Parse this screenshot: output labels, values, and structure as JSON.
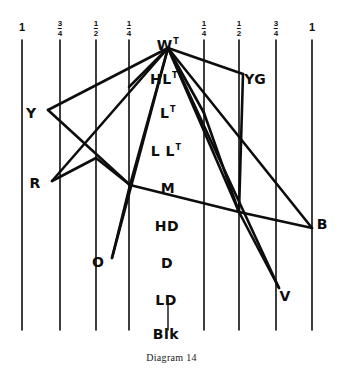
{
  "figure": {
    "caption": "Diagram 14",
    "caption_y": 352,
    "ink_color": "#0d0d0d",
    "background_color": "#ffffff",
    "width": 343,
    "height": 380
  },
  "scale_axis": {
    "name": "chroma-scale",
    "ticks": [
      {
        "label": "1",
        "numerator": "",
        "denominator": "",
        "x": 22,
        "label_y": 22,
        "line_top": 40,
        "line_bottom": 330
      },
      {
        "label": "3/4",
        "numerator": "3",
        "denominator": "4",
        "x": 60,
        "label_y": 20,
        "line_top": 40,
        "line_bottom": 330
      },
      {
        "label": "1/2",
        "numerator": "1",
        "denominator": "2",
        "x": 96,
        "label_y": 20,
        "line_top": 40,
        "line_bottom": 330
      },
      {
        "label": "1/4",
        "numerator": "1",
        "denominator": "4",
        "x": 129,
        "label_y": 20,
        "line_top": 40,
        "line_bottom": 330
      },
      {
        "label": "1/4",
        "numerator": "1",
        "denominator": "4",
        "x": 204,
        "label_y": 20,
        "line_top": 40,
        "line_bottom": 330
      },
      {
        "label": "1/2",
        "numerator": "1",
        "denominator": "2",
        "x": 239,
        "label_y": 20,
        "line_top": 40,
        "line_bottom": 330
      },
      {
        "label": "3/4",
        "numerator": "3",
        "denominator": "4",
        "x": 276,
        "label_y": 20,
        "line_top": 40,
        "line_bottom": 330
      },
      {
        "label": "1",
        "numerator": "",
        "denominator": "",
        "x": 312,
        "label_y": 22,
        "line_top": 40,
        "line_bottom": 330
      }
    ]
  },
  "value_scale": {
    "name": "value-scale-column",
    "items": [
      {
        "id": "w",
        "label": "W",
        "sup": "T",
        "x": 168,
        "y": 45,
        "kind": "node"
      },
      {
        "id": "hlt",
        "label": "HL",
        "sup": "T",
        "x": 164,
        "y": 79,
        "kind": "value"
      },
      {
        "id": "lt",
        "label": "L",
        "sup": "T",
        "x": 168,
        "y": 113,
        "kind": "value"
      },
      {
        "id": "llt",
        "label": "L L",
        "sup": "T",
        "x": 166,
        "y": 151,
        "kind": "value"
      },
      {
        "id": "m",
        "label": "M",
        "sup": "",
        "x": 168,
        "y": 188,
        "kind": "value"
      },
      {
        "id": "hd",
        "label": "HD",
        "sup": "",
        "x": 167,
        "y": 226,
        "kind": "value"
      },
      {
        "id": "d",
        "label": "D",
        "sup": "",
        "x": 167,
        "y": 263,
        "kind": "value"
      },
      {
        "id": "ld",
        "label": "LD",
        "sup": "",
        "x": 166,
        "y": 300,
        "kind": "value"
      },
      {
        "id": "blk",
        "label": "Blk",
        "sup": "",
        "x": 166,
        "y": 334,
        "kind": "value"
      }
    ]
  },
  "hue_nodes": [
    {
      "id": "y",
      "label": "Y",
      "x": 31,
      "y": 113
    },
    {
      "id": "r",
      "label": "R",
      "x": 35,
      "y": 183
    },
    {
      "id": "o",
      "label": "O",
      "x": 98,
      "y": 262
    },
    {
      "id": "yg",
      "label": "YG",
      "x": 255,
      "y": 79
    },
    {
      "id": "b",
      "label": "B",
      "x": 322,
      "y": 224
    },
    {
      "id": "v",
      "label": "V",
      "x": 285,
      "y": 296
    }
  ],
  "chart_data": {
    "type": "line",
    "title": "Diagram 14",
    "xlabel": "",
    "ylabel": "",
    "grid": true,
    "legend_position": "none",
    "x_ticks": [
      "1",
      "3/4",
      "1/2",
      "1/4",
      "1/4",
      "1/2",
      "3/4",
      "1"
    ],
    "y_ticks": [
      "W",
      "HL",
      "L",
      "LL",
      "M",
      "HD",
      "D",
      "LD",
      "Blk"
    ],
    "vertices": [
      {
        "name": "W",
        "x": 168,
        "y": 48
      },
      {
        "name": "Y",
        "x": 48,
        "y": 110
      },
      {
        "name": "R",
        "x": 52,
        "y": 181
      },
      {
        "name": "O",
        "x": 112,
        "y": 258
      },
      {
        "name": "YG",
        "x": 243,
        "y": 74
      },
      {
        "name": "B",
        "x": 312,
        "y": 228
      },
      {
        "name": "V",
        "x": 279,
        "y": 288
      },
      {
        "name": "n1",
        "x": 130,
        "y": 185
      },
      {
        "name": "n2",
        "x": 239,
        "y": 212
      },
      {
        "name": "n3",
        "x": 204,
        "y": 113
      },
      {
        "name": "n4",
        "x": 129,
        "y": 87
      },
      {
        "name": "n5",
        "x": 96,
        "y": 158
      }
    ],
    "edges": [
      [
        "W",
        "Y"
      ],
      [
        "W",
        "R"
      ],
      [
        "W",
        "O"
      ],
      [
        "W",
        "YG"
      ],
      [
        "W",
        "B"
      ],
      [
        "W",
        "V"
      ],
      [
        "W",
        "n1"
      ],
      [
        "W",
        "n2"
      ],
      [
        "W",
        "n3"
      ],
      [
        "W",
        "n4"
      ],
      [
        "Y",
        "n1"
      ],
      [
        "R",
        "n5"
      ],
      [
        "n5",
        "n1"
      ],
      [
        "n1",
        "n2"
      ],
      [
        "n1",
        "O"
      ],
      [
        "n3",
        "n2"
      ],
      [
        "n2",
        "V"
      ],
      [
        "n2",
        "B"
      ],
      [
        "YG",
        "n2"
      ]
    ]
  }
}
